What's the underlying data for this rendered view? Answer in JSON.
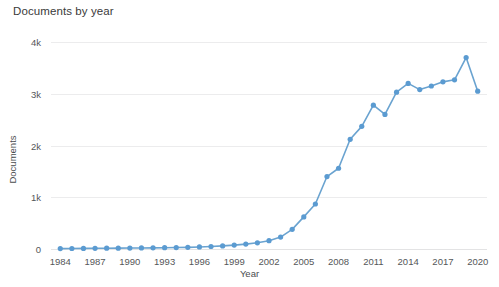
{
  "chart_data": {
    "type": "line",
    "title": "Documents by year",
    "xlabel": "Year",
    "ylabel": "Documents",
    "grid": true,
    "legend": false,
    "series_color": "#5b9bd1",
    "x": [
      1984,
      1985,
      1986,
      1987,
      1988,
      1989,
      1990,
      1991,
      1992,
      1993,
      1994,
      1995,
      1996,
      1997,
      1998,
      1999,
      2000,
      2001,
      2002,
      2003,
      2004,
      2005,
      2006,
      2007,
      2008,
      2009,
      2010,
      2011,
      2012,
      2013,
      2014,
      2015,
      2016,
      2017,
      2018,
      2019,
      2020
    ],
    "values": [
      8,
      10,
      12,
      14,
      15,
      16,
      18,
      20,
      22,
      25,
      28,
      32,
      40,
      48,
      60,
      75,
      95,
      120,
      160,
      230,
      380,
      620,
      870,
      1400,
      1560,
      2120,
      2370,
      2780,
      2600,
      3030,
      3200,
      3080,
      3150,
      3230,
      3270,
      3700,
      3050
    ],
    "xlim": [
      1983.2,
      2020.8
    ],
    "ylim": [
      0,
      4000
    ],
    "x_ticks": [
      1984,
      1987,
      1990,
      1993,
      1996,
      1999,
      2002,
      2005,
      2008,
      2011,
      2014,
      2017,
      2020
    ],
    "x_tick_labels": [
      "1984",
      "1987",
      "1990",
      "1993",
      "1996",
      "1999",
      "2002",
      "2005",
      "2008",
      "2011",
      "2014",
      "2017",
      "2020"
    ],
    "y_ticks": [
      0,
      1000,
      2000,
      3000,
      4000
    ],
    "y_tick_labels": [
      "0",
      "1k",
      "2k",
      "3k",
      "4k"
    ]
  }
}
